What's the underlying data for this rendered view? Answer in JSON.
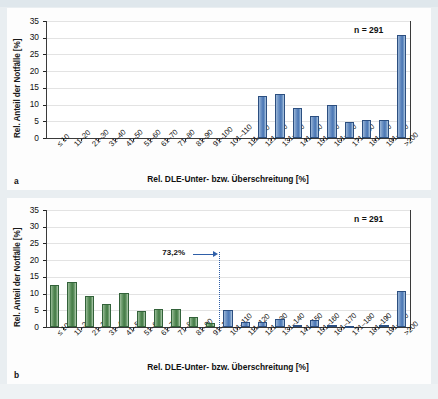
{
  "figure": {
    "panel_a_letter": "a",
    "panel_b_letter": "b",
    "caption": ""
  },
  "chart_data": [
    {
      "id": "panel-a",
      "type": "bar",
      "title": "",
      "xlabel": "Rel. DLE-Unter- bzw. Überschreitung [%]",
      "ylabel": "Rel. Anteil der Notfälle [%]",
      "ylim": [
        0,
        35
      ],
      "yticks": [
        0,
        5,
        10,
        15,
        20,
        25,
        30,
        35
      ],
      "grid": true,
      "legend": "none",
      "annotations": [
        {
          "name": "sample-size",
          "text": "n = 291"
        }
      ],
      "series_color": "#4a76b4",
      "categories": [
        "≤ 10",
        "11–20",
        "21–30",
        "31–40",
        "41–50",
        "51–60",
        "61–70",
        "71–80",
        "81–90",
        "91–100",
        "101–110",
        "111–120",
        "121–130",
        "131–140",
        "141–150",
        "151–160",
        "161–170",
        "171–180",
        "181–190",
        "191–200",
        ">200"
      ],
      "values": [
        0,
        0,
        0,
        0,
        0,
        0,
        0,
        0,
        0,
        0,
        0,
        0,
        12.5,
        13.2,
        9.1,
        6.5,
        9.8,
        4.9,
        5.3,
        5.3,
        30.8
      ]
    },
    {
      "id": "panel-b",
      "type": "bar",
      "title": "",
      "xlabel": "Rel. DLE-Unter- bzw. Überschreitung [%]",
      "ylabel": "Rel. Anteil der Notfälle [%]",
      "ylim": [
        0,
        35
      ],
      "yticks": [
        0,
        5,
        10,
        15,
        20,
        25,
        30,
        35
      ],
      "grid": true,
      "legend": "none",
      "annotations": [
        {
          "name": "sample-size",
          "text": "n = 291"
        },
        {
          "name": "cumulative-marker",
          "text": "73,2%",
          "after_category": "91–100"
        }
      ],
      "categories": [
        "≤ 10",
        "11–20",
        "21–30",
        "31–40",
        "41–50",
        "51–60",
        "61–70",
        "71–80",
        "81–90",
        "91–100",
        "101–110",
        "111–120",
        "121–130",
        "131–140",
        "141–150",
        "151–160",
        "161–170",
        "171–180",
        "181–190",
        "191–200",
        ">200"
      ],
      "values": [
        12.7,
        13.4,
        9.2,
        6.8,
        10.2,
        4.9,
        5.3,
        5.3,
        3.0,
        1.2,
        5.2,
        1.6,
        1.6,
        2.3,
        0.6,
        2.2,
        0.5,
        0.2,
        0.0,
        0.5,
        10.9
      ],
      "colors": [
        "green",
        "green",
        "green",
        "green",
        "green",
        "green",
        "green",
        "green",
        "green",
        "green",
        "blue",
        "blue",
        "blue",
        "blue",
        "blue",
        "blue",
        "blue",
        "blue",
        "blue",
        "blue",
        "blue"
      ],
      "color_green": "#4f8550",
      "color_blue": "#4a76b4"
    }
  ]
}
